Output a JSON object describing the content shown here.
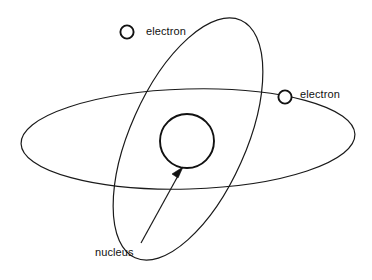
{
  "figure": {
    "background_color": "#ffffff",
    "stroke_color": "#111111"
  },
  "labels": {
    "electron_top": "electron",
    "electron_right": "electron",
    "nucleus": "nucleus"
  },
  "parts": {
    "nucleus": {
      "name": "nucleus",
      "shape": "circle",
      "center_x": 187,
      "center_y": 141,
      "radius": 27
    },
    "electrons": [
      {
        "name": "electron",
        "shape": "circle",
        "center_x": 127,
        "center_y": 32,
        "radius": 7,
        "on_orbit": "tilted-orbit"
      },
      {
        "name": "electron",
        "shape": "circle",
        "center_x": 285,
        "center_y": 97,
        "radius": 7,
        "on_orbit": "horizontal-orbit"
      }
    ],
    "orbits": [
      {
        "name": "horizontal-orbit",
        "shape": "ellipse",
        "center_x": 188,
        "center_y": 139,
        "radius_x": 167,
        "radius_y": 50,
        "rotation_deg": -1.5
      },
      {
        "name": "tilted-orbit",
        "shape": "ellipse",
        "center_x": 188,
        "center_y": 139,
        "radius_x": 58,
        "radius_y": 130,
        "rotation_deg": 24
      }
    ],
    "pointer": {
      "name": "nucleus-pointer",
      "from_x": 141,
      "from_y": 243,
      "to_x": 182,
      "to_y": 169
    }
  }
}
